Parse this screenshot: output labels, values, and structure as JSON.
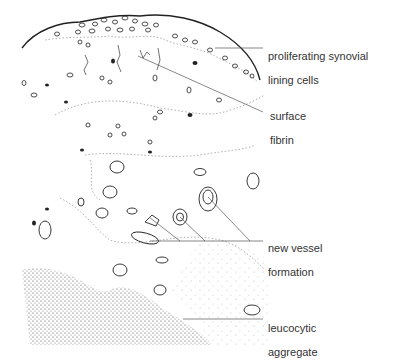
{
  "diagram": {
    "labels": [
      {
        "id": "synovial",
        "line1": "proliferating synovial",
        "line2": "lining cells"
      },
      {
        "id": "fibrin",
        "line1": "surface",
        "line2": "fibrin"
      },
      {
        "id": "vessel",
        "line1": "new vessel",
        "line2": "formation"
      },
      {
        "id": "leucocytic",
        "line1": "leucocytic",
        "line2": "aggregate"
      }
    ],
    "colors": {
      "ink": "#222222",
      "dotted": "#9a9a9a",
      "stipple": "#555555",
      "text": "#333333"
    }
  }
}
